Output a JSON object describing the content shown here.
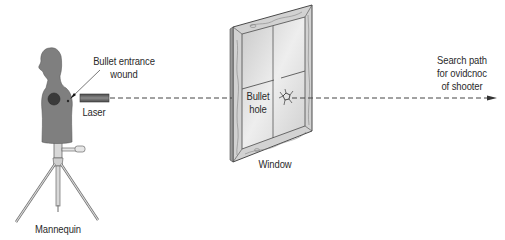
{
  "diagram": {
    "type": "forensic-trajectory-reconstruction",
    "colors": {
      "background": "#ffffff",
      "mannequin_fill": "#7f7f7f",
      "wound_fill": "#3a3a3a",
      "laser_fill": "#5e5e5e",
      "glass_fill": "#dcdcdc",
      "frame_fill": "#cfcfcf",
      "line_color": "#444444",
      "text_color": "#2a2a2a"
    },
    "labels": {
      "mannequin": "Mannequin",
      "bullet_entrance_line1": "Bullet entrance",
      "bullet_entrance_line2": "wound",
      "laser": "Laser",
      "bullet_hole_line1": "Bullet",
      "bullet_hole_line2": "hole",
      "window": "Window",
      "search_line1": "Search path",
      "search_line2": "for ovidcnoc",
      "search_line3": "of shooter"
    },
    "elements": [
      {
        "id": "mannequin",
        "description": "Gray torso mannequin on tripod stand, facing left"
      },
      {
        "id": "entrance-wound",
        "description": "Small mark on mannequin's right side, pointed to by arrow"
      },
      {
        "id": "laser",
        "description": "Rectangular laser device emitting dashed beam rightward"
      },
      {
        "id": "window",
        "description": "Wood-framed window in perspective with bullet hole crack in glass"
      },
      {
        "id": "trajectory",
        "description": "Dashed line from laser through bullet hole, ending in arrowhead"
      }
    ]
  }
}
